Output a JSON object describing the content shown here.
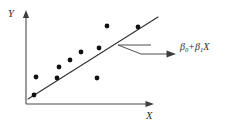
{
  "figure": {
    "background_color": "#ffffff",
    "width": 227,
    "height": 126
  },
  "axes": {
    "y_label": "Y",
    "x_label": "X",
    "axis_color": "#4a4a4a",
    "y_axis": {
      "x": 26,
      "y_top": 13,
      "y_bottom": 104
    },
    "x_axis": {
      "y": 104,
      "x_left": 26,
      "x_right": 152
    },
    "arrowheads": "both-outward"
  },
  "annotation": {
    "beta0": "β",
    "beta0_sub": "0",
    "operator": "+",
    "beta1": "β",
    "beta1_sub": "1",
    "variable": "X",
    "full_text": "β₀ + β₁X",
    "leader_style": "zigzag-with-arrow",
    "text_color": "#2b2b2b"
  },
  "chart_data": {
    "type": "scatter",
    "title": "",
    "xlabel": "X",
    "ylabel": "Y",
    "grid": false,
    "legend": false,
    "point_color": "#111111",
    "point_radius": 2.4,
    "line_color": "#2e2e2e",
    "points_px": [
      {
        "x": 34,
        "y": 95
      },
      {
        "x": 36,
        "y": 77
      },
      {
        "x": 57,
        "y": 78
      },
      {
        "x": 59,
        "y": 67
      },
      {
        "x": 70,
        "y": 60
      },
      {
        "x": 81,
        "y": 52
      },
      {
        "x": 97,
        "y": 78
      },
      {
        "x": 99,
        "y": 48
      },
      {
        "x": 107,
        "y": 26
      },
      {
        "x": 138,
        "y": 27
      }
    ],
    "fit_line_px": {
      "x1": 28,
      "y1": 99,
      "x2": 158,
      "y2": 17
    },
    "leader_px": {
      "h1_x1": 151,
      "h1_x2": 118,
      "h1_y": 45,
      "diag_x1": 118,
      "diag_y1": 45,
      "diag_x2": 141,
      "diag_y2": 54,
      "h2_x1": 141,
      "h2_x2": 168,
      "h2_y": 54,
      "arrow_tip_x": 176,
      "arrow_y": 54
    }
  }
}
